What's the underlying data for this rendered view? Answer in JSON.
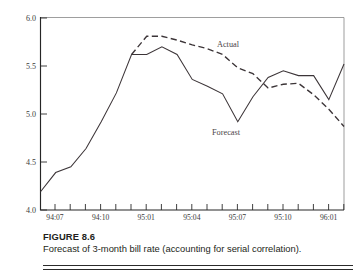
{
  "figure": {
    "number_label": "FIGURE 8.6",
    "caption": "Forecast of 3-month bill rate (accounting for serial correlation)."
  },
  "chart_data": {
    "type": "line",
    "title": "",
    "xlabel": "",
    "ylabel": "",
    "ylim": [
      4.0,
      6.0
    ],
    "ytick_labels": [
      "4.0",
      "4.5",
      "5.0",
      "5.5",
      "6.0"
    ],
    "ytick_values": [
      4.0,
      4.5,
      5.0,
      5.5,
      6.0
    ],
    "grid": false,
    "legend_position": "inline-annotation",
    "x_major_labels": [
      "94:07",
      "94:10",
      "95:01",
      "95:04",
      "95:07",
      "95:10",
      "96:01"
    ],
    "x_tick_count": 20,
    "x": [
      "94:06",
      "94:07",
      "94:08",
      "94:09",
      "94:10",
      "94:11",
      "94:12",
      "95:01",
      "95:02",
      "95:03",
      "95:04",
      "95:05",
      "95:06",
      "95:07",
      "95:08",
      "95:09",
      "95:10",
      "95:11",
      "95:12",
      "96:01",
      "96:02"
    ],
    "series": [
      {
        "name": "Forecast",
        "style": "solid",
        "annotation": "Forecast",
        "values": [
          4.19,
          4.39,
          4.45,
          4.64,
          4.92,
          5.22,
          5.62,
          5.62,
          5.7,
          5.62,
          5.36,
          5.29,
          5.21,
          4.92,
          5.18,
          5.38,
          5.45,
          5.4,
          5.4,
          5.15,
          5.52
        ]
      },
      {
        "name": "Actual",
        "style": "dashed",
        "annotation": "Actual",
        "starts_at": "94:12",
        "values": [
          null,
          null,
          null,
          null,
          null,
          null,
          5.62,
          5.81,
          5.81,
          5.77,
          5.72,
          5.68,
          5.62,
          5.48,
          5.42,
          5.27,
          5.31,
          5.32,
          5.2,
          5.05,
          4.87
        ]
      }
    ]
  }
}
